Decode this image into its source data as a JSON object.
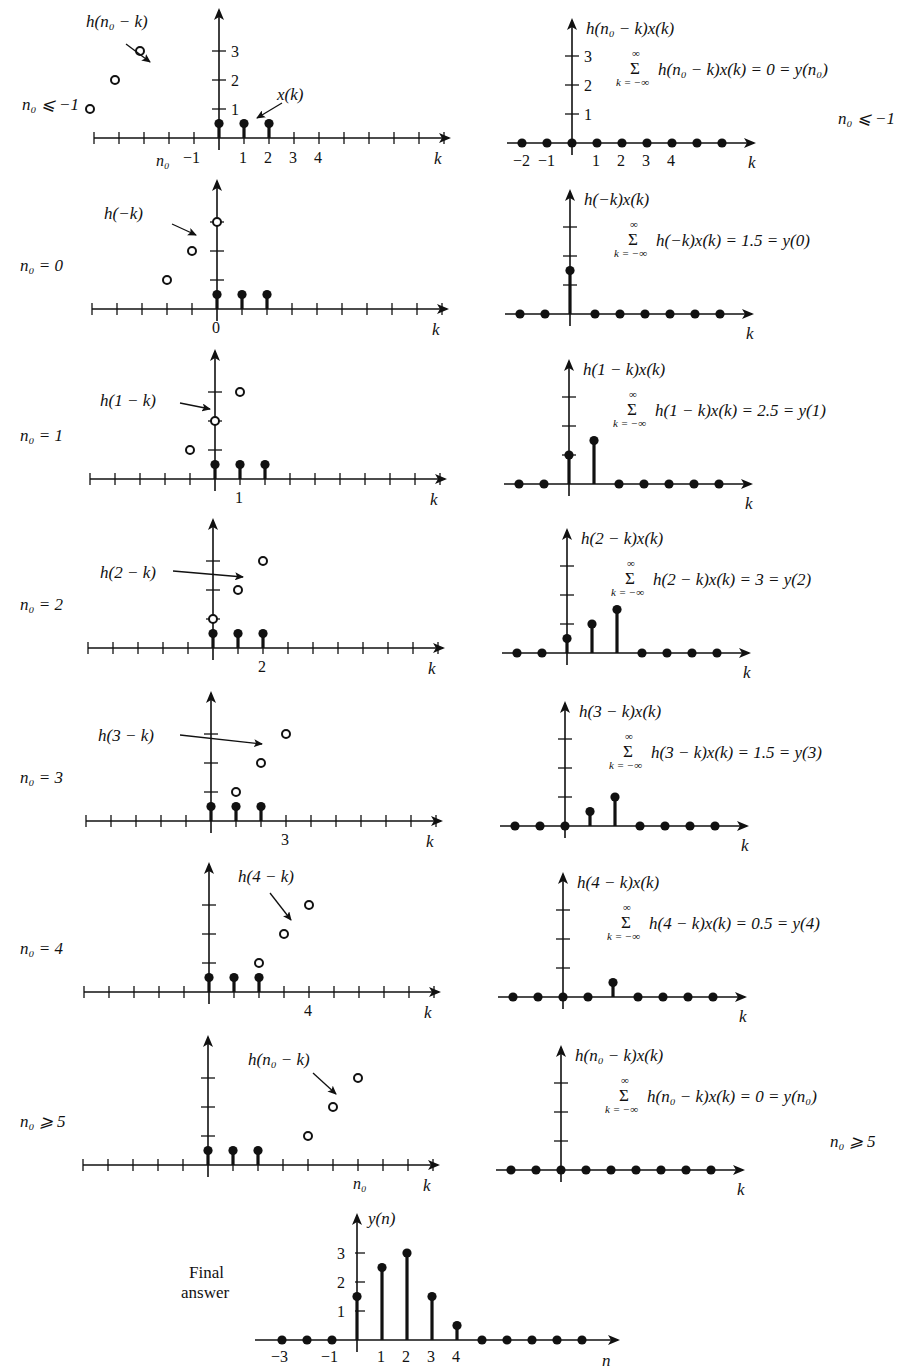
{
  "figure": {
    "x_sequence": {
      "label": "x(k)",
      "k": [
        0,
        1,
        2
      ],
      "values": [
        0.5,
        0.5,
        0.5
      ]
    },
    "h_sequence": {
      "k": [
        0,
        1,
        2
      ],
      "values": [
        1,
        2,
        3
      ]
    },
    "axis_label_k": "k",
    "axis_label_n": "n"
  },
  "rows": [
    {
      "case_label": "n₀ ⩽ −1",
      "case_text": "n0 <= -1",
      "n0": "n0<=-1",
      "h_label": "h(n₀ − k)",
      "x_label": "x(k)",
      "left_ticks_x": [
        "n₀",
        "−1",
        "1",
        "2",
        "3",
        "4"
      ],
      "left_ticks_y": [
        "1",
        "2",
        "3"
      ],
      "h_points": [
        {
          "k": -7,
          "v": 1
        },
        {
          "k": -6,
          "v": 2
        },
        {
          "k": -5,
          "v": 3
        }
      ],
      "product_label": "h(n₀ − k)x(k)",
      "product_ticks_x": [
        "−2",
        "−1",
        "1",
        "2",
        "3",
        "4"
      ],
      "product_ticks_y": [
        "1",
        "2",
        "3"
      ],
      "product_points": [
        {
          "k": -2,
          "v": 0
        },
        {
          "k": -1,
          "v": 0
        },
        {
          "k": 0,
          "v": 0
        },
        {
          "k": 1,
          "v": 0
        },
        {
          "k": 2,
          "v": 0
        },
        {
          "k": 3,
          "v": 0
        },
        {
          "k": 4,
          "v": 0
        },
        {
          "k": 5,
          "v": 0
        },
        {
          "k": 6,
          "v": 0
        }
      ],
      "sum_expr": "h(n₀ − k)x(k) = 0 = y(n₀)",
      "sum_result": 0,
      "side_note": "n₀ ⩽ −1"
    },
    {
      "case_label": "n₀ = 0",
      "n0": 0,
      "h_label": "h(−k)",
      "left_ticks_x": [
        "0"
      ],
      "h_points": [
        {
          "k": -2,
          "v": 1
        },
        {
          "k": -1,
          "v": 2
        },
        {
          "k": 0,
          "v": 3
        }
      ],
      "product_label": "h(−k)x(k)",
      "product_points": [
        {
          "k": -2,
          "v": 0
        },
        {
          "k": -1,
          "v": 0
        },
        {
          "k": 0,
          "v": 1.5
        },
        {
          "k": 1,
          "v": 0
        },
        {
          "k": 2,
          "v": 0
        },
        {
          "k": 3,
          "v": 0
        },
        {
          "k": 4,
          "v": 0
        },
        {
          "k": 5,
          "v": 0
        },
        {
          "k": 6,
          "v": 0
        }
      ],
      "sum_expr": "h(−k)x(k) = 1.5 = y(0)",
      "sum_result": 1.5
    },
    {
      "case_label": "n₀ = 1",
      "n0": 1,
      "h_label": "h(1 − k)",
      "left_ticks_x": [
        "1"
      ],
      "h_points": [
        {
          "k": -1,
          "v": 1
        },
        {
          "k": 0,
          "v": 2
        },
        {
          "k": 1,
          "v": 3
        }
      ],
      "product_label": "h(1 − k)x(k)",
      "product_points": [
        {
          "k": -2,
          "v": 0
        },
        {
          "k": -1,
          "v": 0
        },
        {
          "k": 0,
          "v": 1
        },
        {
          "k": 1,
          "v": 1.5
        },
        {
          "k": 2,
          "v": 0
        },
        {
          "k": 3,
          "v": 0
        },
        {
          "k": 4,
          "v": 0
        },
        {
          "k": 5,
          "v": 0
        },
        {
          "k": 6,
          "v": 0
        }
      ],
      "sum_expr": "h(1 − k)x(k) = 2.5 = y(1)",
      "sum_result": 2.5
    },
    {
      "case_label": "n₀ = 2",
      "n0": 2,
      "h_label": "h(2 − k)",
      "left_ticks_x": [
        "2"
      ],
      "h_points": [
        {
          "k": 0,
          "v": 1
        },
        {
          "k": 1,
          "v": 2
        },
        {
          "k": 2,
          "v": 3
        }
      ],
      "product_label": "h(2 − k)x(k)",
      "product_points": [
        {
          "k": -2,
          "v": 0
        },
        {
          "k": -1,
          "v": 0
        },
        {
          "k": 0,
          "v": 0.5
        },
        {
          "k": 1,
          "v": 1
        },
        {
          "k": 2,
          "v": 1.5
        },
        {
          "k": 3,
          "v": 0
        },
        {
          "k": 4,
          "v": 0
        },
        {
          "k": 5,
          "v": 0
        },
        {
          "k": 6,
          "v": 0
        }
      ],
      "sum_expr": "h(2 − k)x(k) = 3 = y(2)",
      "sum_result": 3
    },
    {
      "case_label": "n₀ = 3",
      "n0": 3,
      "h_label": "h(3 − k)",
      "left_ticks_x": [
        "3"
      ],
      "h_points": [
        {
          "k": 1,
          "v": 1
        },
        {
          "k": 2,
          "v": 2
        },
        {
          "k": 3,
          "v": 3
        }
      ],
      "product_label": "h(3 − k)x(k)",
      "product_points": [
        {
          "k": -2,
          "v": 0
        },
        {
          "k": -1,
          "v": 0
        },
        {
          "k": 0,
          "v": 0
        },
        {
          "k": 1,
          "v": 0.5
        },
        {
          "k": 2,
          "v": 1
        },
        {
          "k": 3,
          "v": 0
        },
        {
          "k": 4,
          "v": 0
        },
        {
          "k": 5,
          "v": 0
        },
        {
          "k": 6,
          "v": 0
        }
      ],
      "sum_expr": "h(3 − k)x(k) = 1.5 = y(3)",
      "sum_result": 1.5
    },
    {
      "case_label": "n₀ = 4",
      "n0": 4,
      "h_label": "h(4 − k)",
      "left_ticks_x": [
        "4"
      ],
      "h_points": [
        {
          "k": 2,
          "v": 1
        },
        {
          "k": 3,
          "v": 2
        },
        {
          "k": 4,
          "v": 3
        }
      ],
      "product_label": "h(4 − k)x(k)",
      "product_points": [
        {
          "k": -2,
          "v": 0
        },
        {
          "k": -1,
          "v": 0
        },
        {
          "k": 0,
          "v": 0
        },
        {
          "k": 1,
          "v": 0
        },
        {
          "k": 2,
          "v": 0.5
        },
        {
          "k": 3,
          "v": 0
        },
        {
          "k": 4,
          "v": 0
        },
        {
          "k": 5,
          "v": 0
        },
        {
          "k": 6,
          "v": 0
        }
      ],
      "sum_expr": "h(4 − k)x(k) = 0.5 = y(4)",
      "sum_result": 0.5
    },
    {
      "case_label": "n₀ ⩾ 5",
      "n0": "n0>=5",
      "h_label": "h(n₀ − k)",
      "left_ticks_x": [
        "n₀"
      ],
      "h_points": [
        {
          "k": 4,
          "v": 1
        },
        {
          "k": 5,
          "v": 2
        },
        {
          "k": 6,
          "v": 3
        }
      ],
      "product_label": "h(n₀ − k)x(k)",
      "product_points": [
        {
          "k": -2,
          "v": 0
        },
        {
          "k": -1,
          "v": 0
        },
        {
          "k": 0,
          "v": 0
        },
        {
          "k": 1,
          "v": 0
        },
        {
          "k": 2,
          "v": 0
        },
        {
          "k": 3,
          "v": 0
        },
        {
          "k": 4,
          "v": 0
        },
        {
          "k": 5,
          "v": 0
        },
        {
          "k": 6,
          "v": 0
        }
      ],
      "sum_expr": "h(n₀ − k)x(k) = 0 = y(n₀)",
      "sum_result": 0,
      "side_note": "n₀ ⩾ 5"
    }
  ],
  "sum_symbol": "Σ",
  "sum_upper": "∞",
  "sum_lower": "k = −∞",
  "final": {
    "label_line1": "Final",
    "label_line2": "answer",
    "y_label": "y(n)",
    "x_axis_label": "n",
    "ticks_x": [
      "−3",
      "−1",
      "1",
      "2",
      "3",
      "4"
    ],
    "ticks_y": [
      "1",
      "2",
      "3"
    ]
  },
  "chart_data": {
    "type": "stem",
    "xlabel": "n",
    "ylabel": "y(n)",
    "x": [
      -3,
      -2,
      -1,
      0,
      1,
      2,
      3,
      4,
      5,
      6,
      7,
      8,
      9
    ],
    "values": [
      0,
      0,
      0,
      1.5,
      2.5,
      3,
      1.5,
      0.5,
      0,
      0,
      0,
      0,
      0
    ],
    "ylim": [
      0,
      3.5
    ],
    "y_ticks": [
      1,
      2,
      3
    ],
    "x_tick_labels": [
      "-3",
      "-1",
      "1",
      "2",
      "3",
      "4"
    ],
    "grid": false,
    "intermediate_sums": [
      {
        "n0": "<=-1",
        "y": 0
      },
      {
        "n0": 0,
        "y": 1.5
      },
      {
        "n0": 1,
        "y": 2.5
      },
      {
        "n0": 2,
        "y": 3
      },
      {
        "n0": 3,
        "y": 1.5
      },
      {
        "n0": 4,
        "y": 0.5
      },
      {
        "n0": ">=5",
        "y": 0
      }
    ]
  }
}
